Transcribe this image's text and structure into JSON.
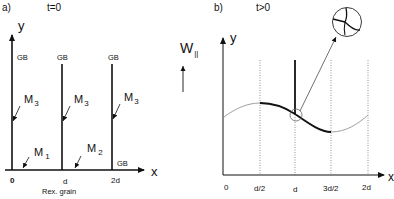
{
  "panel_a": {
    "label": "a)",
    "time": "t=0",
    "y_axis": "y",
    "x_axis": "x",
    "gb_labels": [
      "GB",
      "GB",
      "GB",
      "GB"
    ],
    "m3_labels": [
      "M",
      "M",
      "M"
    ],
    "m3_sub": "3",
    "m1": "M",
    "m1_sub": "1",
    "m2": "M",
    "m2_sub": "2",
    "ticks": [
      "0",
      "d",
      "2d"
    ],
    "caption": "Rex. grain"
  },
  "velocity": {
    "label": "W",
    "sub": "||"
  },
  "panel_b": {
    "label": "b)",
    "time": "t>0",
    "y_axis": "y",
    "x_axis": "x",
    "ticks": [
      "0",
      "d/2",
      "d",
      "3d/2",
      "2d"
    ]
  }
}
